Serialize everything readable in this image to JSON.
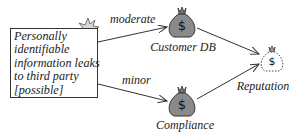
{
  "threat": {
    "lines": [
      "Personally",
      "identifiable",
      "information leaks",
      "to third party",
      "[possible]"
    ],
    "icon": "explosion-icon"
  },
  "edges": [
    {
      "from": "threat",
      "to": "customer_db",
      "label": "moderate"
    },
    {
      "from": "threat",
      "to": "compliance",
      "label": "minor"
    },
    {
      "from": "customer_db",
      "to": "reputation",
      "label": ""
    },
    {
      "from": "compliance",
      "to": "reputation",
      "label": ""
    }
  ],
  "assets": {
    "customer_db": {
      "label": "Customer DB",
      "icon": "money-bag-icon",
      "style": "filled"
    },
    "compliance": {
      "label": "Compliance",
      "icon": "money-bag-icon",
      "style": "filled"
    },
    "reputation": {
      "label": "Reputation",
      "icon": "money-bag-icon",
      "style": "dashed"
    }
  },
  "colors": {
    "bag_fill": "#8a8a8a",
    "bag_dashed_fill": "#ffffff",
    "stroke": "#333333",
    "explosion_fill": "#d8d8d8"
  }
}
